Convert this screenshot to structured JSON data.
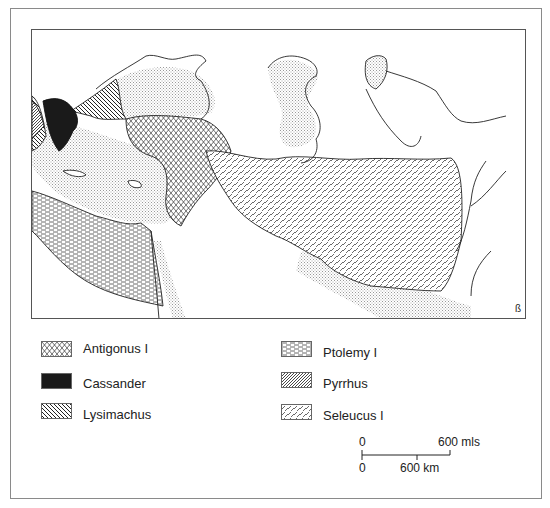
{
  "map": {
    "title": "",
    "regions": [
      {
        "name": "Antigonus I",
        "pattern": "crosshatch-diamond"
      },
      {
        "name": "Cassander",
        "pattern": "solid-black"
      },
      {
        "name": "Lysimachus",
        "pattern": "dense-backslash"
      },
      {
        "name": "Ptolemy I",
        "pattern": "dashed-horizontal"
      },
      {
        "name": "Pyrrhus",
        "pattern": "dense-forward-slash"
      },
      {
        "name": "Seleucus I",
        "pattern": "dashed-forward-slash"
      }
    ],
    "colors": {
      "ink": "#1a1a1a",
      "sea_stipple": "#bdbdbd",
      "frame": "#8a8a8a",
      "background": "#ffffff"
    }
  },
  "legend": {
    "items": [
      {
        "label": "Antigonus I",
        "pattern": "antigonus"
      },
      {
        "label": "Cassander",
        "pattern": "cassander"
      },
      {
        "label": "Lysimachus",
        "pattern": "lysimachus"
      },
      {
        "label": "Ptolemy I",
        "pattern": "ptolemy"
      },
      {
        "label": "Pyrrhus",
        "pattern": "pyrrhus"
      },
      {
        "label": "Seleucus I",
        "pattern": "seleucus"
      }
    ]
  },
  "scale_bar": {
    "top_zero": "0",
    "top_end": "600 mls",
    "bottom_zero": "0",
    "bottom_mid": "600 km"
  }
}
